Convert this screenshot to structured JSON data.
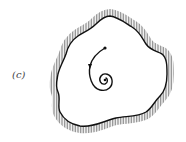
{
  "figure": {
    "panel_label": "(c)",
    "colors": {
      "boundary": "#111111",
      "hatch": "#8a8a8a",
      "trajectory": "#111111",
      "background": "#ffffff"
    }
  }
}
